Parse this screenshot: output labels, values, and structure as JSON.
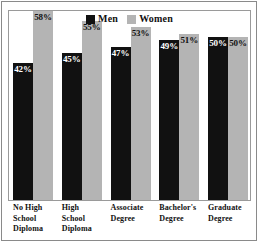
{
  "chart_data": {
    "type": "bar",
    "title": "",
    "subtitle": "",
    "xlabel": "",
    "ylabel": "",
    "ylim": [
      0,
      58
    ],
    "grid": false,
    "legend_position": "top-center",
    "categories": [
      "No High\nSchool\nDiploma",
      "High\nSchool\nDiploma",
      "Associate\nDegree",
      "Bachelor's\nDegree",
      "Graduate\nDegree"
    ],
    "series": [
      {
        "name": "Men",
        "color": "#111111",
        "values": [
          42,
          45,
          47,
          49,
          50
        ],
        "labels": [
          "42%",
          "45%",
          "47%",
          "49%",
          "50%"
        ]
      },
      {
        "name": "Women",
        "color": "#b4b4b4",
        "values": [
          58,
          55,
          53,
          51,
          50
        ],
        "labels": [
          "58%",
          "55%",
          "53%",
          "51%",
          "50%"
        ]
      }
    ]
  },
  "legend": {
    "entries": [
      {
        "label": "Men",
        "swatch": "men-swatch-icon",
        "color": "#111111"
      },
      {
        "label": "Women",
        "swatch": "women-swatch-icon",
        "color": "#b4b4b4"
      }
    ]
  },
  "colors": {
    "men": "#111111",
    "women": "#b4b4b4",
    "background": "#ffffff",
    "frame": "#9a9a9a",
    "outer_frame": "#8a8a8a",
    "text": "#111111"
  }
}
